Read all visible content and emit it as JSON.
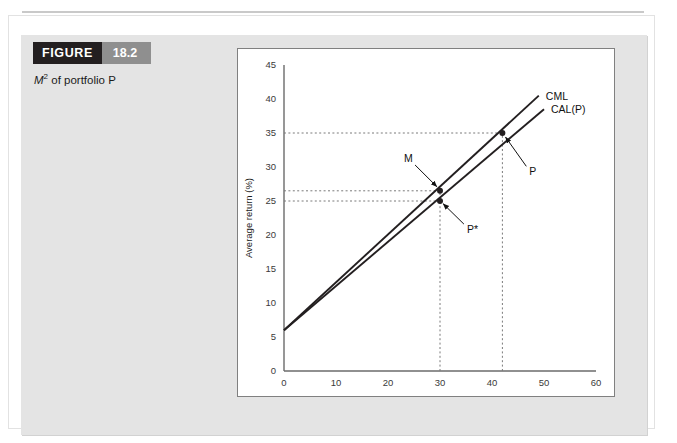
{
  "figure": {
    "kicker": "FIGURE",
    "number": "18.2",
    "caption_lead": "M",
    "caption_sup": "2",
    "caption_rest": " of portfolio P"
  },
  "colors": {
    "kicker_bg": "#231f20",
    "number_bg": "#8f8f8f",
    "panel_bg": "#e4e4e4",
    "chart_bg": "#ffffff",
    "line": "#231f20",
    "axis": "#6b6b6b",
    "dotted": "#7a7a7a"
  },
  "chart_data": {
    "type": "line",
    "title": "",
    "xlabel": "Standard deviation (%)",
    "ylabel": "Average return (%)",
    "xlim": [
      0,
      60
    ],
    "ylim": [
      0,
      45
    ],
    "xticks": [
      0,
      10,
      20,
      30,
      40,
      50,
      60
    ],
    "yticks": [
      0,
      5,
      10,
      15,
      20,
      25,
      30,
      35,
      40,
      45
    ],
    "grid": false,
    "legend": "inline-right-end",
    "series": [
      {
        "name": "CML",
        "label": "CML",
        "x": [
          0,
          49
        ],
        "y": [
          6,
          40.5
        ]
      },
      {
        "name": "CAL(P)",
        "label": "CAL(P)",
        "x": [
          0,
          50
        ],
        "y": [
          6,
          38.5
        ]
      }
    ],
    "points": [
      {
        "name": "M",
        "label": "M",
        "x": 30,
        "y": 26.5,
        "series": "CML"
      },
      {
        "name": "P*",
        "label": "P*",
        "x": 30,
        "y": 25,
        "series": "CAL(P)"
      },
      {
        "name": "P",
        "label": "P",
        "x": 42,
        "y": 35,
        "series": "CAL(P)"
      }
    ],
    "guide_lines": [
      {
        "orientation": "horizontal",
        "value": 35,
        "from_x": 0,
        "to_x": 42
      },
      {
        "orientation": "horizontal",
        "value": 26.5,
        "from_x": 0,
        "to_x": 30
      },
      {
        "orientation": "horizontal",
        "value": 25,
        "from_x": 0,
        "to_x": 30
      },
      {
        "orientation": "vertical",
        "value": 30,
        "from_y": 0,
        "to_y": 26.5
      },
      {
        "orientation": "vertical",
        "value": 42,
        "from_y": 0,
        "to_y": 35
      }
    ],
    "annotations": [
      {
        "label": "M",
        "text_x": 25.2,
        "text_y": 30.3,
        "tip_x": 29.4,
        "tip_y": 27.1
      },
      {
        "label": "P*",
        "text_x": 34.6,
        "text_y": 21.6,
        "tip_x": 30.6,
        "tip_y": 24.6
      },
      {
        "label": "P",
        "text_x": 46.6,
        "text_y": 30.1,
        "tip_x": 42.6,
        "tip_y": 34.4
      }
    ]
  }
}
